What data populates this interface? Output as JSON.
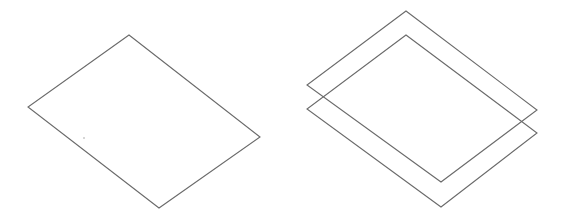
{
  "figure": {
    "width": 563,
    "height": 219,
    "background": "#ffffff",
    "stroke_color": "#6a6a6a",
    "stroke_width": 1.1
  },
  "panels": [
    {
      "id": "single-plane",
      "description": "One isometric parallelogram (plane)",
      "planes": [
        {
          "points": "129,35 28,107 159,208 260,137"
        }
      ]
    },
    {
      "id": "two-stacked-planes",
      "description": "Two isometric parallelograms stacked with vertical offset",
      "planes": [
        {
          "points": "406,11 307,85 441,182 537,110"
        },
        {
          "points": "406,35 307,109 441,207 537,133"
        }
      ]
    }
  ],
  "specks": [
    {
      "x": 83,
      "y": 137
    }
  ]
}
